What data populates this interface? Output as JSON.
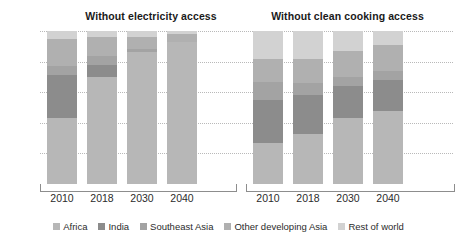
{
  "chart_data": {
    "type": "bar",
    "subtype": "100% stacked column",
    "title": "",
    "panels": [
      {
        "title": "Without electricity access",
        "categories": [
          "2010",
          "2018",
          "2030",
          "2040"
        ],
        "series": [
          {
            "name": "Africa",
            "values": [
              43,
              70,
              86,
              93
            ]
          },
          {
            "name": "India",
            "values": [
              28,
              8,
              0,
              0
            ]
          },
          {
            "name": "Southeast Asia",
            "values": [
              6,
              6,
              2,
              0
            ]
          },
          {
            "name": "Other developing Asia",
            "values": [
              18,
              12,
              8,
              5
            ]
          },
          {
            "name": "Rest of world",
            "values": [
              5,
              4,
              4,
              2
            ]
          }
        ]
      },
      {
        "title": "Without clean cooking access",
        "categories": [
          "2010",
          "2018",
          "2030",
          "2040"
        ],
        "series": [
          {
            "name": "Africa",
            "values": [
              27,
              33,
              43,
              48
            ]
          },
          {
            "name": "India",
            "values": [
              28,
              25,
              21,
              20
            ]
          },
          {
            "name": "Southeast Asia",
            "values": [
              12,
              8,
              6,
              6
            ]
          },
          {
            "name": "Other developing Asia",
            "values": [
              15,
              16,
              17,
              17
            ]
          },
          {
            "name": "Rest of world",
            "values": [
              18,
              18,
              13,
              9
            ]
          }
        ]
      }
    ],
    "xlabel": "",
    "ylabel": "",
    "ylim": [
      0,
      100
    ],
    "yticks": [
      "20%",
      "40%",
      "60%",
      "80%",
      "100%"
    ],
    "ytick_values": [
      20,
      40,
      60,
      80,
      100
    ],
    "grid": true,
    "legend_position": "bottom",
    "legend": [
      {
        "name": "Africa",
        "color": "#b7b7b7"
      },
      {
        "name": "India",
        "color": "#8c8c8c"
      },
      {
        "name": "Southeast Asia",
        "color": "#a3a3a3"
      },
      {
        "name": "Other developing Asia",
        "color": "#b0b0b0"
      },
      {
        "name": "Rest of world",
        "color": "#d2d2d2"
      }
    ]
  },
  "colors": {
    "africa": "#b7b7b7",
    "india": "#8c8c8c",
    "southeast_asia": "#a3a3a3",
    "other_developing_asia": "#b0b0b0",
    "rest_of_world": "#d2d2d2",
    "gridline": "#b9b9b9",
    "axis": "#8d8d8d",
    "text": "#2b2b2b",
    "background": "#ffffff"
  }
}
